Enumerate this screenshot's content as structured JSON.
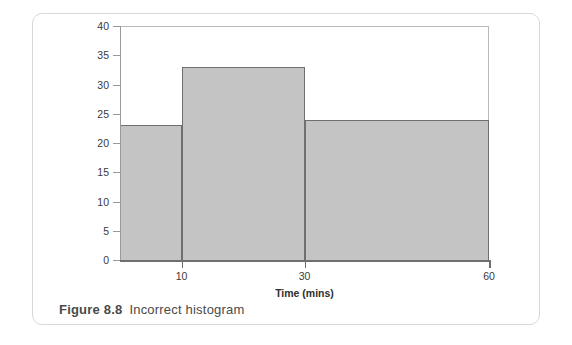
{
  "figure": {
    "caption_number": "Figure 8.8",
    "caption_text": "Incorrect histogram"
  },
  "colors": {
    "bar_fill": "#c4c4c4",
    "bar_stroke": "#6f6f6f",
    "axis": "#9a9a9a",
    "card_border": "#d8d8d8",
    "text": "#3a3a3a",
    "background": "#ffffff"
  },
  "chart_data": {
    "type": "bar",
    "title": "",
    "subtitle": "",
    "xlabel": "Time (mins)",
    "ylabel": "",
    "xlim": [
      0,
      60
    ],
    "ylim": [
      0,
      40
    ],
    "grid": false,
    "legend": null,
    "x_ticks": [
      10,
      30,
      60
    ],
    "x_tick_labels": [
      "10",
      "30",
      "60"
    ],
    "y_ticks": [
      0,
      5,
      10,
      15,
      20,
      25,
      30,
      35,
      40
    ],
    "y_tick_labels": [
      "0",
      "5",
      "10",
      "15",
      "20",
      "25",
      "30",
      "35",
      "40"
    ],
    "bins": [
      {
        "label": "0-10",
        "x_start": 0,
        "x_end": 10,
        "value": 23
      },
      {
        "label": "10-30",
        "x_start": 10,
        "x_end": 30,
        "value": 33
      },
      {
        "label": "30-60",
        "x_start": 30,
        "x_end": 60,
        "value": 24
      }
    ],
    "categories": [
      "0-10",
      "10-30",
      "30-60"
    ],
    "values": [
      23,
      33,
      24
    ],
    "annotations": []
  }
}
